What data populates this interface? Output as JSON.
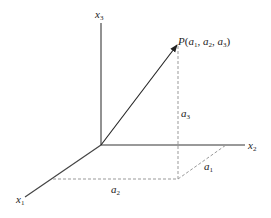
{
  "diagram": {
    "point_label": "P",
    "point_coords_open": "(",
    "point_a": "a",
    "sub_1": "1",
    "sub_2": "2",
    "sub_3": "3",
    "comma": ", ",
    "close": ")",
    "axes": {
      "x1": {
        "base": "x",
        "sub": "1"
      },
      "x2": {
        "base": "x",
        "sub": "2"
      },
      "x3": {
        "base": "x",
        "sub": "3"
      }
    },
    "components": {
      "a1": {
        "base": "a",
        "sub": "1"
      },
      "a2": {
        "base": "a",
        "sub": "2"
      },
      "a3": {
        "base": "a",
        "sub": "3"
      }
    },
    "colors": {
      "axis": "#555555",
      "vector": "#222222",
      "dashed": "#888888"
    }
  }
}
